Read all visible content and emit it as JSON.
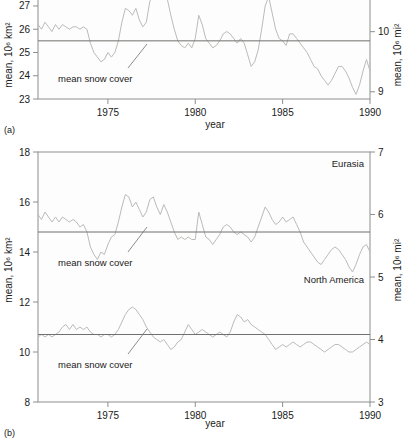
{
  "figure": {
    "panel_a_label": "(a)",
    "panel_b_label": "(b)",
    "axis_titles": {
      "x": "year",
      "y_left": "mean, 10⁶ km²",
      "y_right": "mean, 10⁶ mi²"
    },
    "annotation": "mean snow cover"
  },
  "chart_data": [
    {
      "type": "line",
      "title": "",
      "panel": "(a)",
      "xlabel": "year",
      "ylabel": "mean, 10⁶ km²",
      "ylabel_right": "mean, 10⁶ mi²",
      "xlim": [
        1971.0,
        1990.0
      ],
      "ylim": [
        23,
        27.6
      ],
      "ylim_right": [
        8.88,
        10.66
      ],
      "xticks": [
        1975,
        1980,
        1985,
        1990
      ],
      "yticks": [
        23,
        24,
        25,
        26,
        27
      ],
      "yticks_right": [
        9,
        10
      ],
      "grid": false,
      "legend": "none",
      "series": [
        {
          "name": "Northern Hemisphere snow cover",
          "annotation": "mean snow cover",
          "mean_value": 25.5,
          "x": [
            1971.0,
            1971.2,
            1971.4,
            1971.6,
            1971.8,
            1972.0,
            1972.2,
            1972.4,
            1972.6,
            1972.8,
            1973.0,
            1973.2,
            1973.4,
            1973.6,
            1973.8,
            1974.0,
            1974.2,
            1974.4,
            1974.6,
            1974.8,
            1975.0,
            1975.2,
            1975.4,
            1975.6,
            1975.8,
            1976.0,
            1976.2,
            1976.4,
            1976.6,
            1976.8,
            1977.0,
            1977.2,
            1977.4,
            1977.6,
            1977.8,
            1978.0,
            1978.2,
            1978.4,
            1978.6,
            1978.8,
            1979.0,
            1979.2,
            1979.4,
            1979.6,
            1979.8,
            1980.0,
            1980.2,
            1980.4,
            1980.6,
            1980.8,
            1981.0,
            1981.2,
            1981.4,
            1981.6,
            1981.8,
            1982.0,
            1982.2,
            1982.4,
            1982.6,
            1982.8,
            1983.0,
            1983.2,
            1983.4,
            1983.6,
            1983.8,
            1984.0,
            1984.2,
            1984.4,
            1984.6,
            1984.8,
            1985.0,
            1985.2,
            1985.4,
            1985.6,
            1985.8,
            1986.0,
            1986.2,
            1986.4,
            1986.6,
            1986.8,
            1987.0,
            1987.2,
            1987.4,
            1987.6,
            1987.8,
            1988.0,
            1988.2,
            1988.4,
            1988.6,
            1988.8,
            1989.0,
            1989.2,
            1989.4,
            1989.6,
            1989.8,
            1990.0
          ],
          "y": [
            26.2,
            26.0,
            26.3,
            26.1,
            25.9,
            26.2,
            26.0,
            26.2,
            26.1,
            26.0,
            26.1,
            26.1,
            26.0,
            26.1,
            26.0,
            25.4,
            25.0,
            24.8,
            24.6,
            24.7,
            25.0,
            24.8,
            25.0,
            25.5,
            26.3,
            26.9,
            26.8,
            26.6,
            26.9,
            26.4,
            26.1,
            26.3,
            27.2,
            27.5,
            27.6,
            27.4,
            27.5,
            27.3,
            26.6,
            26.0,
            25.5,
            25.3,
            25.2,
            25.4,
            25.2,
            25.6,
            26.6,
            26.2,
            25.6,
            25.4,
            25.2,
            25.3,
            25.5,
            25.8,
            25.9,
            25.8,
            25.6,
            25.4,
            25.6,
            25.4,
            24.9,
            24.4,
            24.6,
            25.1,
            26.0,
            27.0,
            27.4,
            26.7,
            26.0,
            25.6,
            25.5,
            25.3,
            25.8,
            25.8,
            25.6,
            25.4,
            25.2,
            25.0,
            24.7,
            24.4,
            24.3,
            24.0,
            23.8,
            23.6,
            23.8,
            24.1,
            24.4,
            24.4,
            24.2,
            23.9,
            23.5,
            23.2,
            23.6,
            24.2,
            24.7,
            24.2
          ]
        }
      ]
    },
    {
      "type": "line",
      "title": "",
      "panel": "(b)",
      "xlabel": "year",
      "ylabel": "mean, 10⁶ km²",
      "ylabel_right": "mean, 10⁶ mi²",
      "xlim": [
        1971.0,
        1990.0
      ],
      "ylim": [
        8,
        18
      ],
      "ylim_right": [
        3,
        7
      ],
      "xticks": [
        1975,
        1980,
        1985,
        1990
      ],
      "yticks": [
        8,
        10,
        12,
        14,
        16,
        18
      ],
      "yticks_right": [
        3,
        4,
        5,
        6,
        7
      ],
      "grid": false,
      "legend": "inline-labels",
      "series": [
        {
          "name": "Eurasia",
          "label": "Eurasia",
          "annotation": "mean snow cover",
          "mean_value": 14.8,
          "x": [
            1971.0,
            1971.2,
            1971.4,
            1971.6,
            1971.8,
            1972.0,
            1972.2,
            1972.4,
            1972.6,
            1972.8,
            1973.0,
            1973.2,
            1973.4,
            1973.6,
            1973.8,
            1974.0,
            1974.2,
            1974.4,
            1974.6,
            1974.8,
            1975.0,
            1975.2,
            1975.4,
            1975.6,
            1975.8,
            1976.0,
            1976.2,
            1976.4,
            1976.6,
            1976.8,
            1977.0,
            1977.2,
            1977.4,
            1977.6,
            1977.8,
            1978.0,
            1978.2,
            1978.4,
            1978.6,
            1978.8,
            1979.0,
            1979.2,
            1979.4,
            1979.6,
            1979.8,
            1980.0,
            1980.2,
            1980.4,
            1980.6,
            1980.8,
            1981.0,
            1981.2,
            1981.4,
            1981.6,
            1981.8,
            1982.0,
            1982.2,
            1982.4,
            1982.6,
            1982.8,
            1983.0,
            1983.2,
            1983.4,
            1983.6,
            1983.8,
            1984.0,
            1984.2,
            1984.4,
            1984.6,
            1984.8,
            1985.0,
            1985.2,
            1985.4,
            1985.6,
            1985.8,
            1986.0,
            1986.2,
            1986.4,
            1986.6,
            1986.8,
            1987.0,
            1987.2,
            1987.4,
            1987.6,
            1987.8,
            1988.0,
            1988.2,
            1988.4,
            1988.6,
            1988.8,
            1989.0,
            1989.2,
            1989.4,
            1989.6,
            1989.8,
            1990.0
          ],
          "y": [
            15.5,
            15.3,
            15.6,
            15.4,
            15.2,
            15.4,
            15.2,
            15.4,
            15.3,
            15.2,
            15.3,
            15.2,
            15.0,
            15.1,
            14.8,
            14.2,
            13.9,
            13.7,
            14.0,
            13.9,
            14.3,
            14.6,
            14.7,
            15.2,
            15.8,
            16.3,
            16.2,
            15.8,
            16.0,
            15.7,
            15.4,
            15.6,
            16.1,
            16.2,
            15.8,
            15.5,
            15.9,
            15.6,
            15.2,
            14.8,
            14.5,
            14.6,
            14.5,
            14.6,
            14.5,
            14.5,
            15.6,
            15.1,
            14.6,
            14.5,
            14.3,
            14.5,
            14.7,
            15.0,
            15.1,
            15.0,
            14.8,
            14.7,
            14.8,
            14.7,
            14.6,
            14.4,
            14.6,
            15.0,
            15.4,
            15.8,
            15.6,
            15.3,
            15.1,
            15.2,
            15.4,
            15.2,
            15.3,
            15.4,
            15.1,
            14.8,
            14.4,
            14.2,
            14.0,
            13.8,
            13.6,
            13.5,
            13.7,
            13.9,
            14.1,
            14.2,
            14.1,
            13.9,
            13.7,
            13.4,
            13.2,
            13.5,
            13.9,
            14.2,
            14.3,
            14.0
          ]
        },
        {
          "name": "North America",
          "label": "North America",
          "annotation": "mean snow cover",
          "mean_value": 10.7,
          "x": [
            1971.0,
            1971.2,
            1971.4,
            1971.6,
            1971.8,
            1972.0,
            1972.2,
            1972.4,
            1972.6,
            1972.8,
            1973.0,
            1973.2,
            1973.4,
            1973.6,
            1973.8,
            1974.0,
            1974.2,
            1974.4,
            1974.6,
            1974.8,
            1975.0,
            1975.2,
            1975.4,
            1975.6,
            1975.8,
            1976.0,
            1976.2,
            1976.4,
            1976.6,
            1976.8,
            1977.0,
            1977.2,
            1977.4,
            1977.6,
            1977.8,
            1978.0,
            1978.2,
            1978.4,
            1978.6,
            1978.8,
            1979.0,
            1979.2,
            1979.4,
            1979.6,
            1979.8,
            1980.0,
            1980.2,
            1980.4,
            1980.6,
            1980.8,
            1981.0,
            1981.2,
            1981.4,
            1981.6,
            1981.8,
            1982.0,
            1982.2,
            1982.4,
            1982.6,
            1982.8,
            1983.0,
            1983.2,
            1983.4,
            1983.6,
            1983.8,
            1984.0,
            1984.2,
            1984.4,
            1984.6,
            1984.8,
            1985.0,
            1985.2,
            1985.4,
            1985.6,
            1985.8,
            1986.0,
            1986.2,
            1986.4,
            1986.6,
            1986.8,
            1987.0,
            1987.2,
            1987.4,
            1987.6,
            1987.8,
            1988.0,
            1988.2,
            1988.4,
            1988.6,
            1988.8,
            1989.0,
            1989.2,
            1989.4,
            1989.6,
            1989.8,
            1990.0
          ],
          "y": [
            10.6,
            10.7,
            10.6,
            10.7,
            10.6,
            10.7,
            10.8,
            11.0,
            11.1,
            10.9,
            11.1,
            10.9,
            11.0,
            10.9,
            11.0,
            10.8,
            10.7,
            10.7,
            10.6,
            10.7,
            10.7,
            10.6,
            10.7,
            10.9,
            11.2,
            11.5,
            11.7,
            11.8,
            11.7,
            11.5,
            11.3,
            11.0,
            10.8,
            10.6,
            10.5,
            10.4,
            10.5,
            10.3,
            10.1,
            10.2,
            10.4,
            10.5,
            10.8,
            11.1,
            10.9,
            10.7,
            10.8,
            10.9,
            10.8,
            10.7,
            10.6,
            10.7,
            10.8,
            10.7,
            10.6,
            10.8,
            11.2,
            11.5,
            11.4,
            11.2,
            11.3,
            11.1,
            11.0,
            10.9,
            10.8,
            10.7,
            10.5,
            10.3,
            10.1,
            10.2,
            10.3,
            10.2,
            10.3,
            10.4,
            10.3,
            10.2,
            10.3,
            10.4,
            10.4,
            10.3,
            10.2,
            10.1,
            10.0,
            10.1,
            10.2,
            10.3,
            10.3,
            10.2,
            10.1,
            10.0,
            10.0,
            10.1,
            10.2,
            10.3,
            10.4,
            10.3
          ]
        }
      ]
    }
  ]
}
